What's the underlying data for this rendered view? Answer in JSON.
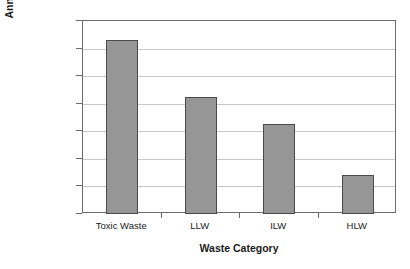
{
  "chart_data": {
    "type": "bar",
    "title": "",
    "xlabel": "Waste Category",
    "ylabel": "Annual Arisings (cubic metres)",
    "categories": [
      "Toxic Waste",
      "LLW",
      "ILW",
      "HLW"
    ],
    "values": [
      2000000,
      18000,
      1800,
      25
    ],
    "yscale": "log",
    "ylim": [
      1,
      10000000
    ],
    "ytick_values": [
      10000000,
      1000000,
      100000,
      10000,
      1000,
      100,
      10,
      1
    ],
    "ytick_labels": [
      "10 000 000",
      "1 000 000",
      "100 000",
      "10 000",
      "1000",
      "100",
      "10",
      "1"
    ],
    "grid": "horizontal",
    "legend": "none",
    "bar_color": "#969696",
    "bar_edge_color": "#4a4a4a",
    "grid_color": "#c8c8c8",
    "axis_color": "#6b6b6b",
    "background_color": "#ffffff"
  }
}
